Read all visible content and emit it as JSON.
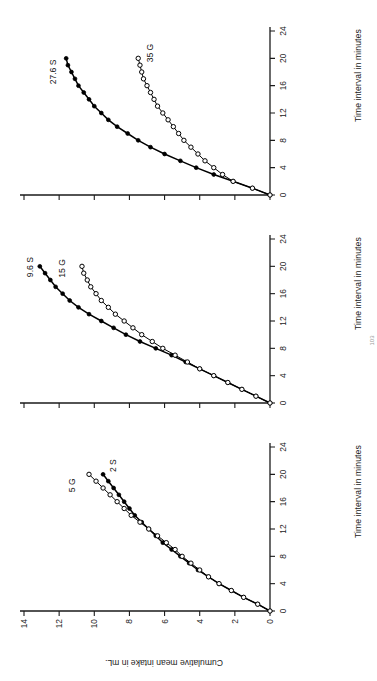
{
  "figure": {
    "page_number": "103",
    "axis": {
      "x_label": "Time interval in minutes",
      "y_label": "Cumulative mean intake in mL.",
      "x_ticks": [
        "0",
        "4",
        "8",
        "12",
        "16",
        "20",
        "24"
      ],
      "y_ticks": [
        "0",
        "2",
        "4",
        "6",
        "8",
        "10",
        "12",
        "14"
      ],
      "xlim": [
        0,
        24
      ],
      "ylim": [
        0,
        14
      ]
    },
    "colors": {
      "ink": "#1b1b1b",
      "line": "#000000",
      "open_marker_fill": "#ffffff",
      "closed_marker_fill": "#000000",
      "background": "#ffffff"
    }
  },
  "chart_data": [
    {
      "type": "line",
      "panel": 1,
      "title": "",
      "xlabel": "Time interval in minutes",
      "ylabel": "Cumulative mean intake in mL.",
      "xlim": [
        0,
        24
      ],
      "ylim": [
        0,
        14
      ],
      "grid": false,
      "legend": "inline-annotations",
      "series": [
        {
          "name": "2 S",
          "marker": "filled-circle",
          "label_text": "2 S",
          "x": [
            0,
            1,
            2,
            3,
            4,
            5,
            6,
            7,
            8,
            9,
            10,
            11,
            12,
            13,
            14,
            15,
            16,
            17,
            18,
            19,
            20
          ],
          "y": [
            0.0,
            0.7,
            1.5,
            2.2,
            2.9,
            3.5,
            4.1,
            4.6,
            5.1,
            5.6,
            6.1,
            6.5,
            6.9,
            7.3,
            7.7,
            8.0,
            8.3,
            8.6,
            8.9,
            9.2,
            9.5
          ]
        },
        {
          "name": "5 G",
          "marker": "open-circle",
          "label_text": "5 G",
          "x": [
            0,
            1,
            2,
            3,
            4,
            5,
            6,
            7,
            8,
            9,
            10,
            11,
            12,
            13,
            14,
            15,
            16,
            17,
            18,
            19,
            20
          ],
          "y": [
            0.0,
            0.7,
            1.5,
            2.2,
            2.9,
            3.5,
            4.0,
            4.5,
            5.0,
            5.4,
            5.9,
            6.4,
            6.9,
            7.4,
            7.9,
            8.3,
            8.7,
            9.1,
            9.5,
            9.9,
            10.3
          ]
        }
      ]
    },
    {
      "type": "line",
      "panel": 2,
      "title": "",
      "xlabel": "Time interval in minutes",
      "ylabel": "",
      "xlim": [
        0,
        24
      ],
      "ylim": [
        0,
        14
      ],
      "grid": false,
      "legend": "inline-annotations",
      "series": [
        {
          "name": "9.6 S",
          "marker": "filled-circle",
          "label_text": "9.6 S",
          "x": [
            0,
            1,
            2,
            3,
            4,
            5,
            6,
            7,
            8,
            9,
            10,
            11,
            12,
            13,
            14,
            15,
            16,
            17,
            18,
            19,
            20
          ],
          "y": [
            0.0,
            0.8,
            1.6,
            2.4,
            3.2,
            4.0,
            4.8,
            5.6,
            6.5,
            7.4,
            8.2,
            8.9,
            9.6,
            10.3,
            10.9,
            11.4,
            11.8,
            12.2,
            12.5,
            12.8,
            13.1
          ]
        },
        {
          "name": "15 G",
          "marker": "open-circle",
          "label_text": "15 G",
          "x": [
            0,
            1,
            2,
            3,
            4,
            5,
            6,
            7,
            8,
            9,
            10,
            11,
            12,
            13,
            14,
            15,
            16,
            17,
            18,
            19,
            20
          ],
          "y": [
            0.0,
            0.8,
            1.6,
            2.4,
            3.2,
            4.0,
            4.7,
            5.4,
            6.1,
            6.7,
            7.3,
            7.8,
            8.3,
            8.8,
            9.2,
            9.6,
            9.9,
            10.2,
            10.4,
            10.6,
            10.7
          ]
        }
      ]
    },
    {
      "type": "line",
      "panel": 3,
      "title": "",
      "xlabel": "Time interval in minutes",
      "ylabel": "",
      "xlim": [
        0,
        24
      ],
      "ylim": [
        0,
        14
      ],
      "grid": false,
      "legend": "inline-annotations",
      "series": [
        {
          "name": "27.6 S",
          "marker": "filled-circle",
          "label_text": "27.6 S",
          "x": [
            0,
            1,
            2,
            3,
            4,
            5,
            6,
            7,
            8,
            9,
            10,
            11,
            12,
            13,
            14,
            15,
            16,
            17,
            18,
            19,
            20
          ],
          "y": [
            0.0,
            1.0,
            2.1,
            3.2,
            4.2,
            5.1,
            6.0,
            6.8,
            7.5,
            8.1,
            8.7,
            9.2,
            9.6,
            10.0,
            10.3,
            10.6,
            10.9,
            11.1,
            11.3,
            11.5,
            11.6
          ]
        },
        {
          "name": "35 G",
          "marker": "open-circle",
          "label_text": "35 G",
          "x": [
            0,
            1,
            2,
            3,
            4,
            5,
            6,
            7,
            8,
            9,
            10,
            11,
            12,
            13,
            14,
            15,
            16,
            17,
            18,
            19,
            20
          ],
          "y": [
            0.0,
            1.0,
            2.1,
            2.7,
            3.2,
            3.7,
            4.1,
            4.5,
            4.9,
            5.2,
            5.5,
            5.8,
            6.1,
            6.4,
            6.6,
            6.8,
            7.0,
            7.2,
            7.3,
            7.4,
            7.5
          ]
        }
      ]
    }
  ]
}
